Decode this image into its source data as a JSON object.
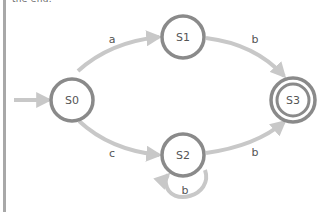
{
  "header": {
    "cut_text": "the end."
  },
  "colors": {
    "state_stroke": "#8a8a8a",
    "edge_stroke": "#c8c8c8",
    "label": "#555555",
    "left_bar": "#a8a8a8"
  },
  "diagram": {
    "type": "finite-state-automaton",
    "start_state": "S0",
    "accept_states": [
      "S3"
    ],
    "states": [
      {
        "id": "S0",
        "label": "S0",
        "cx": 72,
        "cy": 100,
        "accepting": false
      },
      {
        "id": "S1",
        "label": "S1",
        "cx": 183,
        "cy": 37,
        "accepting": false
      },
      {
        "id": "S2",
        "label": "S2",
        "cx": 183,
        "cy": 155,
        "accepting": false
      },
      {
        "id": "S3",
        "label": "S3",
        "cx": 293,
        "cy": 100,
        "accepting": true
      }
    ],
    "transitions": [
      {
        "from": "S0",
        "to": "S1",
        "label": "a"
      },
      {
        "from": "S1",
        "to": "S3",
        "label": "b"
      },
      {
        "from": "S0",
        "to": "S2",
        "label": "c"
      },
      {
        "from": "S2",
        "to": "S3",
        "label": "b"
      },
      {
        "from": "S2",
        "to": "S2",
        "label": "b"
      }
    ]
  }
}
